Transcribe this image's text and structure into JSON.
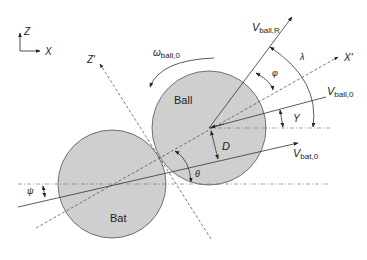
{
  "diagram": {
    "type": "ball-bat collision geometry",
    "colors": {
      "circle_fill": "#cfcfcf",
      "circle_stroke": "#555555",
      "line": "#333333",
      "background": "#ffffff"
    },
    "axes": {
      "z_label": "Z",
      "x_label": "X"
    },
    "objects": {
      "ball_label": "Ball",
      "bat_label": "Bat"
    },
    "rotated_axes": {
      "z_prime": "Z'",
      "x_prime": "X'"
    },
    "vectors": {
      "v_ball_r": {
        "main": "V",
        "sub": "ball,R"
      },
      "v_ball_0": {
        "main": "V",
        "sub": "ball,0"
      },
      "v_bat_0": {
        "main": "V",
        "sub": "bat,0"
      },
      "omega_ball_0": {
        "main": "ω",
        "sub": "ball,0"
      }
    },
    "angles": {
      "lambda": "λ",
      "phi": "φ",
      "gamma": "Y",
      "theta": "θ",
      "psi": "ψ"
    },
    "distances": {
      "offset": "D"
    }
  }
}
